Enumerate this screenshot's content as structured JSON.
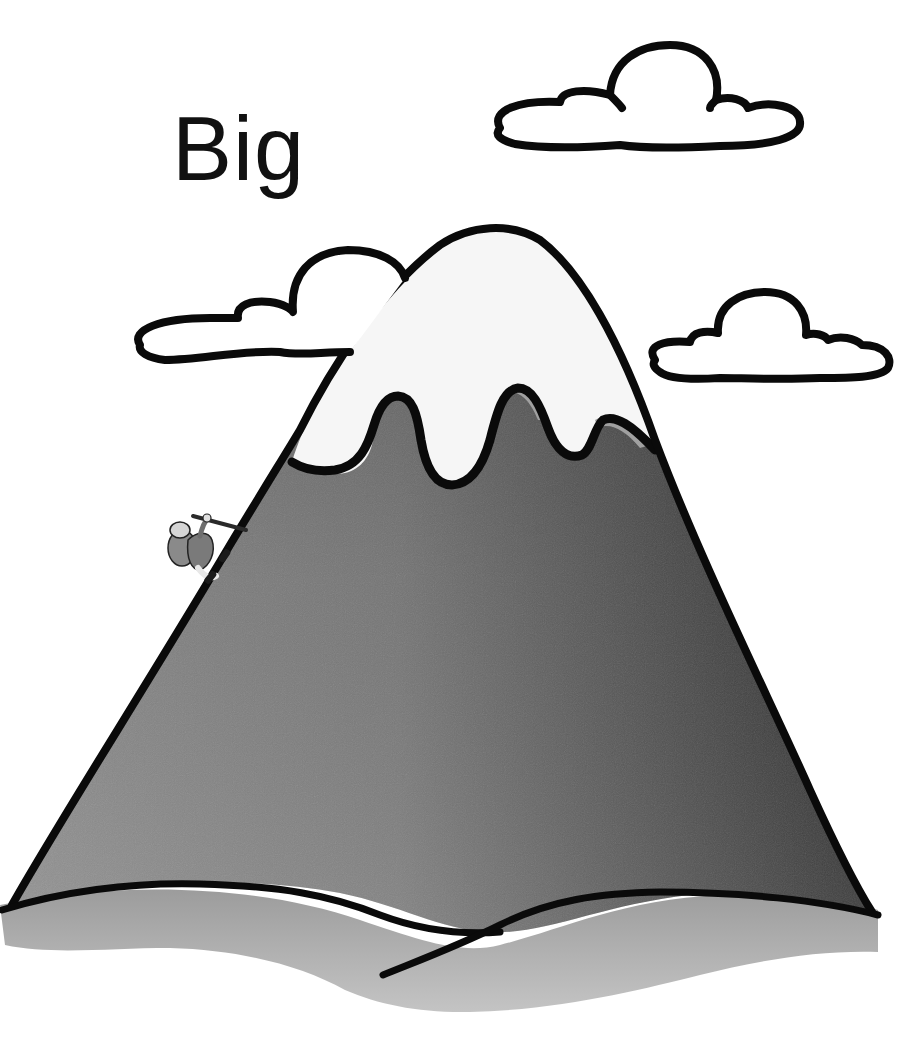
{
  "title": "Big",
  "scene": {
    "description": "Cartoon illustration of a big snow-capped mountain with a tiny climber on its left slope and three clouds in the sky",
    "elements": [
      "mountain",
      "snow-cap",
      "climber",
      "cloud-top-right",
      "cloud-left",
      "cloud-right",
      "ground-shadow"
    ]
  },
  "colors": {
    "background": "#ffffff",
    "outline": "#0a0a0a",
    "mountain_light": "#8a8a8a",
    "mountain_dark": "#3c3c3c",
    "snow": "#f4f4f4",
    "snow_shadow": "#9a9a9a",
    "ground_shadow": "#a8a8a8"
  }
}
